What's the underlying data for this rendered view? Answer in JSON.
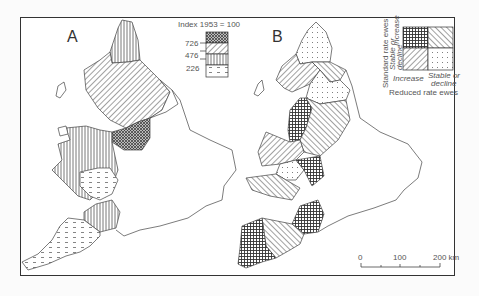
{
  "panels": [
    {
      "letter": "A"
    },
    {
      "letter": "B"
    }
  ],
  "legend_a": {
    "title": "Index 1953 = 100",
    "ticks": [
      "726",
      "476",
      "226"
    ],
    "classes": [
      {
        "pattern": "crosshatch-dense",
        "range": ">726"
      },
      {
        "pattern": "diagonal",
        "range": "476–726"
      },
      {
        "pattern": "vertical",
        "range": "226–476"
      },
      {
        "pattern": "dashes",
        "range": "<226"
      }
    ]
  },
  "legend_b": {
    "y_axis_title": "Standard rate ewes",
    "y_increase": "Increase",
    "y_stable_line1": "Stable or",
    "y_stable_line2": "decline",
    "x_increase": "Increase",
    "x_stable_line1": "Stable or",
    "x_stable_line2": "decline",
    "x_axis_title": "Reduced rate ewes"
  },
  "scale_bar": {
    "ticks": [
      "0",
      "100",
      "200 km"
    ]
  }
}
